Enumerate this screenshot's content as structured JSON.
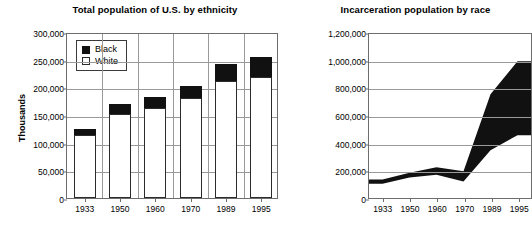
{
  "figure": {
    "panels": [
      {
        "id": "total-population",
        "title": "Total population of U.S. by ethnicity",
        "ylabel": "Thousands"
      },
      {
        "id": "incarceration-population",
        "title": "Incarceration population by race",
        "ylabel": ""
      }
    ]
  },
  "legend": {
    "black_label": "Black",
    "white_label": "White"
  },
  "chart_data": [
    {
      "type": "bar",
      "title": "Total population of U.S. by ethnicity",
      "xlabel": "",
      "ylabel": "Thousands",
      "ylim": [
        0,
        300000
      ],
      "ytick_labels": [
        "0",
        "50,000",
        "100,000",
        "150,000",
        "200,000",
        "250,000",
        "300,000"
      ],
      "yticks": [
        0,
        50000,
        100000,
        150000,
        200000,
        250000,
        300000
      ],
      "grid": true,
      "stacked": true,
      "legend_position": "top-left",
      "categories": [
        "1933",
        "1950",
        "1960",
        "1970",
        "1989",
        "1995"
      ],
      "series": [
        {
          "name": "White",
          "color": "#ffffff",
          "values": [
            114000,
            151000,
            163000,
            180000,
            211000,
            219000
          ]
        },
        {
          "name": "Black",
          "color": "#111111",
          "values": [
            11000,
            19000,
            19000,
            23000,
            31000,
            36000
          ]
        }
      ],
      "totals": [
        125000,
        170000,
        182000,
        203000,
        242000,
        255000
      ]
    },
    {
      "type": "area",
      "title": "Incarceration population by race",
      "xlabel": "",
      "ylabel": "",
      "ylim": [
        0,
        1200000
      ],
      "ytick_labels": [
        "0",
        "200,000",
        "400,000",
        "600,000",
        "800,000",
        "1,000,000",
        "1,200,000"
      ],
      "yticks": [
        0,
        200000,
        400000,
        600000,
        800000,
        1000000,
        1200000
      ],
      "grid": true,
      "band_fill": "#111111",
      "x": [
        "1933",
        "1950",
        "1960",
        "1970",
        "1989",
        "1995"
      ],
      "series": [
        {
          "name": "lower-boundary",
          "values": [
            105000,
            150000,
            170000,
            120000,
            350000,
            460000
          ]
        },
        {
          "name": "upper-boundary",
          "values": [
            135000,
            185000,
            225000,
            195000,
            760000,
            1000000
          ]
        }
      ]
    }
  ]
}
